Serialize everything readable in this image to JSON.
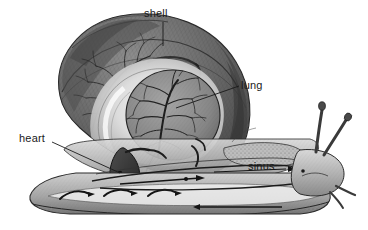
{
  "figure": {
    "style": "grayscale pencil illustration",
    "background_color": "#ffffff",
    "ink_color": "#1a1a1a"
  },
  "labels": [
    {
      "id": "shell",
      "text": "shell",
      "x": 144,
      "y": 8,
      "leader": {
        "x1": 163,
        "y1": 22,
        "x2": 163,
        "y2": 46
      }
    },
    {
      "id": "lung",
      "text": "lung",
      "x": 241,
      "y": 80,
      "leader": {
        "x1": 239,
        "y1": 86,
        "x2": 176,
        "y2": 108
      }
    },
    {
      "id": "heart",
      "text": "heart",
      "x": 19,
      "y": 133,
      "leader": {
        "x1": 52,
        "y1": 142,
        "x2": 120,
        "y2": 173
      }
    },
    {
      "id": "sinus",
      "text": "sinus",
      "x": 248,
      "y": 161,
      "leader": null
    }
  ],
  "structures": [
    {
      "id": "shell",
      "name": "shell",
      "description": "coiled spiral shell with whorl bands and branching mantle veins"
    },
    {
      "id": "lung",
      "name": "lung",
      "description": "circular pulmonary sac with dendritic vessel tree"
    },
    {
      "id": "heart",
      "name": "heart",
      "description": "dark elongated heart beneath the lung"
    },
    {
      "id": "sinus",
      "name": "sinus",
      "description": "blood sinus channel running through the foot"
    },
    {
      "id": "foot",
      "name": "foot",
      "description": "muscular stippled foot and sole"
    },
    {
      "id": "tentacles",
      "name": "tentacles",
      "description": "two long eye tentacles and two short sensory tentacles"
    },
    {
      "id": "mantle",
      "name": "mantle collar",
      "description": "stippled mantle collar behind the head"
    }
  ],
  "palette": {
    "shell_dark": "#4a4a4a",
    "shell_mid": "#7d7d7d",
    "shell_light": "#b4b4b4",
    "body_mid": "#9a9a9a",
    "body_light": "#d6d6d6",
    "organ_dark": "#3c3c3c",
    "highlight": "#f4f4f4"
  }
}
